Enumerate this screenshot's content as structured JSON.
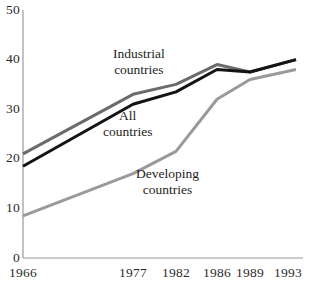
{
  "chart_data": {
    "type": "line",
    "title": "",
    "subtitle": "",
    "xlabel": "",
    "ylabel": "",
    "x": [
      1966,
      1977,
      1982,
      1986,
      1989,
      1993
    ],
    "xtick_labels": [
      "1966",
      "1977",
      "1982",
      "1986",
      "1989",
      "1993"
    ],
    "ytick_labels": [
      "0",
      "10",
      "20",
      "30",
      "40",
      "50"
    ],
    "yticks": [
      0,
      10,
      20,
      30,
      40,
      50
    ],
    "ylim": [
      0,
      50
    ],
    "xlim": [
      1966,
      1993
    ],
    "grid": false,
    "legend_position": "inline-annotations",
    "series": [
      {
        "name": "Industrial countries",
        "label_line1": "Industrial",
        "label_line2": "countries",
        "color": "#6b6b6b",
        "values": [
          21.0,
          33.0,
          35.0,
          39.0,
          37.5,
          40.0
        ]
      },
      {
        "name": "All countries",
        "label_line1": "All",
        "label_line2": "countries",
        "color": "#141414",
        "values": [
          18.5,
          31.0,
          33.5,
          38.0,
          37.5,
          40.0
        ]
      },
      {
        "name": "Developing countries",
        "label_line1": "Developing",
        "label_line2": "countries",
        "color": "#9a9a9a",
        "values": [
          8.5,
          17.0,
          21.5,
          32.0,
          36.0,
          38.0
        ]
      }
    ],
    "axis_color": "#9a9a9a",
    "annotations": [
      {
        "text_line1": "Industrial",
        "text_line2": "countries",
        "series": "Industrial countries"
      },
      {
        "text_line1": "All",
        "text_line2": "countries",
        "series": "All countries"
      },
      {
        "text_line1": "Developing",
        "text_line2": "countries",
        "series": "Developing countries"
      }
    ]
  },
  "axis": {
    "y_ticks": [
      {
        "label": "50",
        "top": 3
      },
      {
        "label": "40",
        "top": 52
      },
      {
        "label": "30",
        "top": 102
      },
      {
        "label": "20",
        "top": 151
      },
      {
        "label": "10",
        "top": 201
      },
      {
        "label": "0",
        "top": 251
      }
    ],
    "x_ticks": [
      {
        "label": "1966",
        "left": 3
      },
      {
        "label": "1977",
        "left": 113
      },
      {
        "label": "1982",
        "left": 156
      },
      {
        "label": "1986",
        "left": 197
      },
      {
        "label": "1989",
        "left": 230
      },
      {
        "label": "1993",
        "left": 268
      }
    ]
  },
  "labels": {
    "industrial": {
      "line1": "Industrial",
      "line2": "countries",
      "left": 113,
      "top": 46
    },
    "all": {
      "line1": "All",
      "line2": "countries",
      "left": 103,
      "top": 108
    },
    "developing": {
      "line1": "Developing",
      "line2": "countries",
      "left": 136,
      "top": 166
    }
  }
}
